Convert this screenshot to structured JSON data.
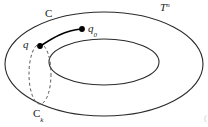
{
  "figure": {
    "background_color": "#ffffff",
    "stroke_color": "#2b2b2b",
    "dot_color": "#000000",
    "dashed_color": "#555555",
    "width": 208,
    "height": 127
  },
  "labels": {
    "manifold": {
      "base": "T",
      "superscript": "n"
    },
    "curve_c": "C",
    "point_q": "q",
    "point_q0": {
      "base": "q",
      "subscript": "0"
    },
    "curve_ck": {
      "base": "C",
      "subscript": "k"
    }
  },
  "points": [
    {
      "name": "q",
      "x": 40,
      "y": 46
    },
    {
      "name": "q0",
      "x": 82,
      "y": 29
    }
  ],
  "shapes": {
    "outer_ellipse": {
      "cx": 104,
      "cy": 64,
      "rx": 99,
      "ry": 53
    },
    "hole_ellipse": {
      "cx": 104,
      "cy": 64,
      "rx": 55,
      "ry": 23
    },
    "meridian_dashed": {
      "cx": 40,
      "cy": 75,
      "rx": 11,
      "ry": 30
    },
    "arc_q_to_q0": {
      "from": "q",
      "to": "q0"
    }
  },
  "corner_artifact": "("
}
